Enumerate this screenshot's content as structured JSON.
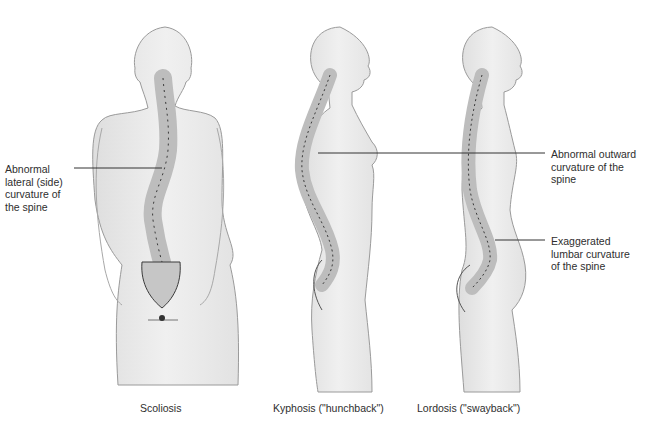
{
  "figure": {
    "panels": [
      {
        "id": "scoliosis",
        "caption": "Scoliosis",
        "view": "posterior",
        "annotation": "Abnormal lateral (side) curvature of the spine",
        "annotation_lines": [
          "Abnormal",
          "lateral (side)",
          "curvature of",
          "the spine"
        ]
      },
      {
        "id": "kyphosis",
        "caption": "Kyphosis (\"hunchback\")",
        "view": "lateral",
        "annotation": "Abnormal outward curvature of the spine",
        "annotation_lines": [
          "Abnormal outward",
          "curvature of the",
          "spine"
        ]
      },
      {
        "id": "lordosis",
        "caption": "Lordosis (\"swayback\")",
        "view": "lateral",
        "annotation": "Exaggerated lumbar curvature of the spine",
        "annotation_lines": [
          "Exaggerated",
          "lumbar curvature",
          "of the spine"
        ]
      }
    ],
    "colors": {
      "body_fill": "#ececec",
      "body_outline": "#9a9a9a",
      "vertebra_fill": "#cfcfcf",
      "vertebra_outline": "#3a3a3a",
      "leader_line": "#333333",
      "text": "#2e2e2e"
    }
  }
}
